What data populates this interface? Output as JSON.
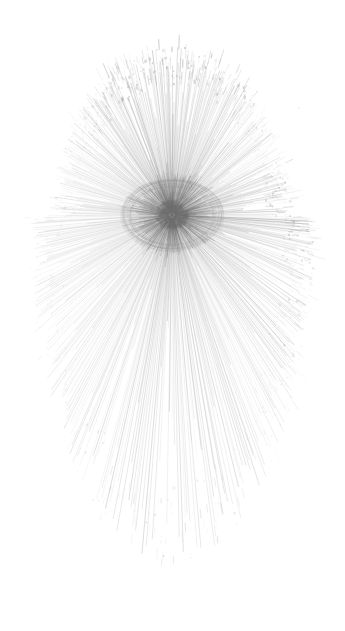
{
  "artwork": {
    "title": "Radial Line Eye",
    "subject": "human-eye",
    "medium": "generative radial line drawing",
    "canvas": {
      "width": 345,
      "height": 631,
      "background_color": "#ffffff"
    },
    "palette": {
      "background": "#ffffff",
      "stroke_base": "#6e6e6e",
      "pupil_dark": "#6e6e6e",
      "iris_mid": "#8c8c8c",
      "ray_light": "#b8b8b8",
      "rim_texture": "#9c9c9c"
    },
    "focus": {
      "center_x": 172,
      "center_y": 215,
      "pupil_radius": 15,
      "iris_inner_radius": 17,
      "iris_outer_radius": 44,
      "note": "pupil is the darkest cluster; rays converge here"
    },
    "silhouette": {
      "shape": "egg",
      "left": 38,
      "right": 307,
      "top": 60,
      "bottom": 545,
      "narrow_end": "top",
      "broad_end": "bottom",
      "top_radius_x": 112,
      "top_radius_y": 158,
      "bottom_radius_x": 134,
      "bottom_radius_y": 332
    },
    "rays": {
      "count": 620,
      "description": "thin straight strokes radiating from the pupil outward to the egg boundary",
      "min_width": 0.3,
      "max_width": 1.0,
      "inner_start_radius": 6,
      "opacity_near_center": 0.55,
      "opacity_mid": 0.16,
      "opacity_at_rim": 0.42
    },
    "density_zones": [
      {
        "name": "pupil-core",
        "angle_deg": 0,
        "span_deg": 360,
        "weight": 1.0
      },
      {
        "name": "left-rim",
        "angle_deg": 180,
        "span_deg": 70,
        "weight": 0.95
      },
      {
        "name": "bottom-rim",
        "angle_deg": 90,
        "span_deg": 120,
        "weight": 1.0
      },
      {
        "name": "upper-left-rim",
        "angle_deg": 225,
        "span_deg": 60,
        "weight": 0.7
      },
      {
        "name": "top-crown",
        "angle_deg": 270,
        "span_deg": 80,
        "weight": 0.72
      },
      {
        "name": "upper-right-rim",
        "angle_deg": 315,
        "span_deg": 55,
        "weight": 0.45
      },
      {
        "name": "right-rim",
        "angle_deg": 0,
        "span_deg": 60,
        "weight": 0.5
      }
    ],
    "rim_texture": {
      "description": "stippled and hatched clusters where rays terminate at the silhouette edge",
      "fleck_count": 1700,
      "fleck_min_size": 0.4,
      "fleck_max_size": 2.4,
      "band_inner": 0.82,
      "band_outer": 1.06
    },
    "iris_texture": {
      "description": "short dense radial fibres forming the iris ring around the pupil",
      "fibre_count": 300,
      "opacity": 0.3
    },
    "stray_marks": [
      {
        "name": "speck-above-crown",
        "x": 185,
        "y": 48,
        "size": 2.0,
        "opacity": 0.5
      },
      {
        "name": "speck-upper-right",
        "x": 299,
        "y": 108,
        "size": 1.3,
        "opacity": 0.35
      },
      {
        "name": "speck-left-edge",
        "x": 44,
        "y": 262,
        "size": 1.2,
        "opacity": 0.35
      }
    ]
  }
}
